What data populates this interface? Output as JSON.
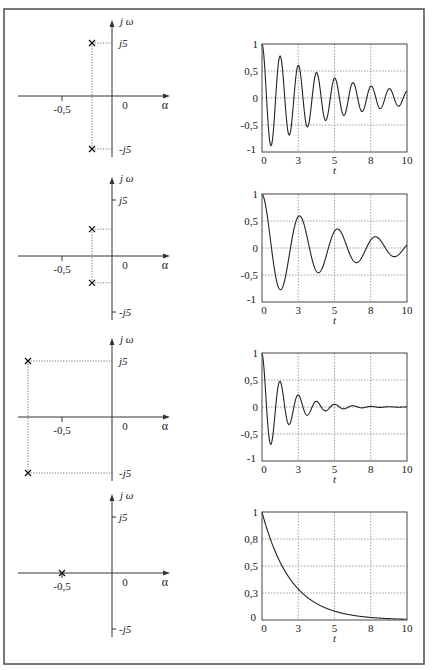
{
  "figure": {
    "frame": {
      "x": 4,
      "y": 9,
      "w": 420,
      "h": 655
    },
    "rows": [
      {
        "pole_zero": {
          "axis_labels": {
            "imag": "j ω",
            "real": "α",
            "origin": "0",
            "real_tick": "-0,5",
            "imag_pos": "j5",
            "imag_neg": "-j5"
          },
          "poles": [
            {
              "alpha": -0.2,
              "omega": 5
            },
            {
              "alpha": -0.2,
              "omega": -5
            }
          ],
          "show_imag_ticks": false
        }
      },
      {
        "pole_zero": {
          "axis_labels": {
            "imag": "j ω",
            "real": "α",
            "origin": "0",
            "real_tick": "-0,5",
            "imag_pos": "j5",
            "imag_neg": "-j5"
          },
          "poles": [
            {
              "alpha": -0.2,
              "omega": 2.4
            },
            {
              "alpha": -0.2,
              "omega": -2.4
            }
          ],
          "show_imag_ticks": true
        }
      },
      {
        "pole_zero": {
          "axis_labels": {
            "imag": "j ω",
            "real": "α",
            "origin": "0",
            "real_tick": "-0,5",
            "imag_pos": "j5",
            "imag_neg": "-j5"
          },
          "poles": [
            {
              "alpha": -0.84,
              "omega": 5
            },
            {
              "alpha": -0.84,
              "omega": -5
            }
          ],
          "show_imag_ticks": false
        }
      },
      {
        "pole_zero": {
          "axis_labels": {
            "imag": "j ω",
            "real": "α",
            "origin": "0",
            "real_tick": "-0,5",
            "imag_pos": "j5",
            "imag_neg": "-j5"
          },
          "poles": [
            {
              "alpha": -0.5,
              "omega": 0
            }
          ],
          "show_imag_ticks": true
        }
      }
    ]
  },
  "chart_data": [
    {
      "type": "line",
      "title": "",
      "xlabel": "t",
      "ylabel": "",
      "xlim": [
        0,
        10
      ],
      "ylim": [
        -1,
        1
      ],
      "xticks": [
        0,
        2.5,
        5,
        7.5,
        10
      ],
      "xtick_labels": [
        "0",
        "3",
        "5",
        "8",
        "10"
      ],
      "yticks": [
        -1,
        -0.5,
        0,
        0.5,
        1
      ],
      "ytick_labels": [
        "-1",
        "-0,5",
        "0",
        "0,5",
        "1"
      ],
      "grid": true,
      "series": [
        {
          "name": "h(t)",
          "formula": "exp(-0.2 t) cos(5 t)",
          "decay": 0.2,
          "omega": 5,
          "kind": "damped_cos"
        }
      ]
    },
    {
      "type": "line",
      "title": "",
      "xlabel": "t",
      "ylabel": "",
      "xlim": [
        0,
        10
      ],
      "ylim": [
        -1,
        1
      ],
      "xticks": [
        0,
        2.5,
        5,
        7.5,
        10
      ],
      "xtick_labels": [
        "0",
        "3",
        "5",
        "8",
        "10"
      ],
      "yticks": [
        -1,
        -0.5,
        0,
        0.5,
        1
      ],
      "ytick_labels": [
        "-1",
        "-0,5",
        "0",
        "0,5",
        "1"
      ],
      "grid": true,
      "series": [
        {
          "name": "h(t)",
          "formula": "exp(-0.2 t) cos(2.4 t)",
          "decay": 0.2,
          "omega": 2.4,
          "kind": "damped_cos"
        }
      ]
    },
    {
      "type": "line",
      "title": "",
      "xlabel": "t",
      "ylabel": "",
      "xlim": [
        0,
        10
      ],
      "ylim": [
        -1,
        1
      ],
      "xticks": [
        0,
        2.5,
        5,
        7.5,
        10
      ],
      "xtick_labels": [
        "0",
        "3",
        "5",
        "8",
        "10"
      ],
      "yticks": [
        -1,
        -0.5,
        0,
        0.5,
        1
      ],
      "ytick_labels": [
        "-1",
        "-0,5",
        "0",
        "0,5",
        "1"
      ],
      "grid": true,
      "series": [
        {
          "name": "h(t)",
          "formula": "exp(-0.84 t) cos(5 t)",
          "decay": 0.6,
          "omega": 5,
          "kind": "damped_cos"
        }
      ]
    },
    {
      "type": "line",
      "title": "",
      "xlabel": "t",
      "ylabel": "",
      "xlim": [
        0,
        10
      ],
      "ylim": [
        0,
        1
      ],
      "xticks": [
        0,
        2.5,
        5,
        7.5,
        10
      ],
      "xtick_labels": [
        "0",
        "3",
        "5",
        "8",
        "10"
      ],
      "yticks": [
        0,
        0.25,
        0.5,
        0.75,
        1
      ],
      "ytick_labels": [
        "0",
        "0,3",
        "0,5",
        "0,8",
        "1"
      ],
      "grid": true,
      "series": [
        {
          "name": "h(t)",
          "formula": "exp(-0.5 t)",
          "decay": 0.5,
          "omega": 0,
          "kind": "exp"
        }
      ]
    }
  ]
}
